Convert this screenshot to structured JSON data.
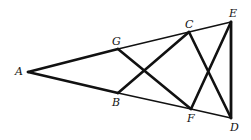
{
  "diagram": {
    "type": "geometry-figure",
    "points": {
      "A": {
        "label": "A",
        "x": 28,
        "y": 72
      },
      "G": {
        "label": "G",
        "x": 118,
        "y": 49
      },
      "B": {
        "label": "B",
        "x": 118,
        "y": 93
      },
      "C": {
        "label": "C",
        "x": 189,
        "y": 32
      },
      "E": {
        "label": "E",
        "x": 231,
        "y": 22
      },
      "F": {
        "label": "F",
        "x": 191,
        "y": 109
      },
      "D": {
        "label": "D",
        "x": 231,
        "y": 118
      }
    },
    "segments": [
      {
        "from": "A",
        "to": "G",
        "weight": "thick"
      },
      {
        "from": "G",
        "to": "C",
        "weight": "thin"
      },
      {
        "from": "C",
        "to": "E",
        "weight": "thin"
      },
      {
        "from": "A",
        "to": "B",
        "weight": "thick"
      },
      {
        "from": "B",
        "to": "F",
        "weight": "thin"
      },
      {
        "from": "F",
        "to": "D",
        "weight": "thin"
      },
      {
        "from": "G",
        "to": "F",
        "weight": "thick"
      },
      {
        "from": "B",
        "to": "C",
        "weight": "thick"
      },
      {
        "from": "C",
        "to": "D",
        "weight": "thick"
      },
      {
        "from": "F",
        "to": "E",
        "weight": "thick"
      },
      {
        "from": "E",
        "to": "D",
        "weight": "thick"
      }
    ],
    "colors": {
      "stroke": "#111111",
      "background": "#ffffff"
    }
  }
}
